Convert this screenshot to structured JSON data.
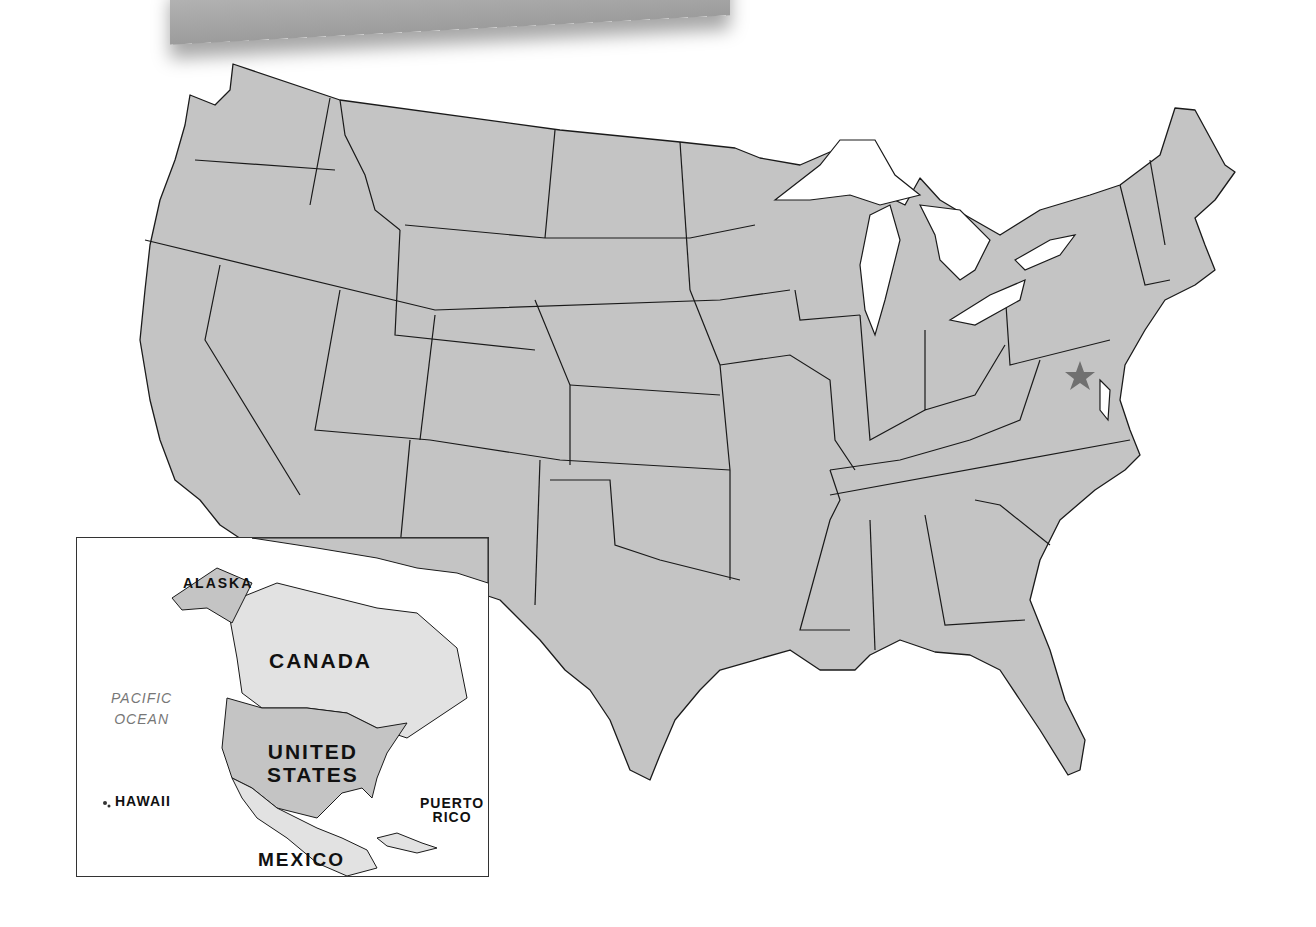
{
  "map": {
    "title": "United States",
    "capital_marker": {
      "label": "Washington, D.C.",
      "icon": "star-icon",
      "color": "#707070"
    },
    "colors": {
      "land": "#c4c4c4",
      "water": "#ffffff",
      "border": "#1a1a1a",
      "other_land": "#e2e2e2"
    }
  },
  "inset": {
    "labels": {
      "alaska": "ALASKA",
      "canada": "CANADA",
      "pacific_ocean_line1": "PACIFIC",
      "pacific_ocean_line2": "OCEAN",
      "united_states_line1": "UNITED",
      "united_states_line2": "STATES",
      "hawaii": "HAWAII",
      "puerto_rico_line1": "PUERTO",
      "puerto_rico_line2": "RICO",
      "mexico": "MEXICO"
    }
  }
}
